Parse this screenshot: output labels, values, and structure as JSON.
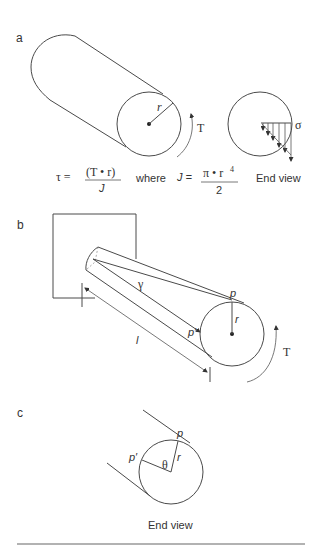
{
  "figure": {
    "panels": [
      {
        "id": "a",
        "label": "a",
        "radius_label": "r",
        "torque_label": "T",
        "stress_label": "σ",
        "end_view_label": "End view",
        "formula": {
          "lhs": "τ =",
          "numerator": "(T • r)",
          "denominator": "J",
          "connector": "where",
          "j_lhs": "J =",
          "j_numerator": "π • r",
          "j_exponent": "4",
          "j_denominator": "2"
        }
      },
      {
        "id": "b",
        "label": "b",
        "shear_angle_label": "γ",
        "point_label": "p",
        "point_prime_label": "p′",
        "radius_label": "r",
        "length_label": "l",
        "torque_label": "T"
      },
      {
        "id": "c",
        "label": "c",
        "point_label": "p",
        "point_prime_label": "p′",
        "angle_label": "θ",
        "radius_label": "r",
        "caption": "End view"
      }
    ],
    "colors": {
      "line": "#4a4a4a",
      "text": "#333333",
      "rule": "#999999"
    }
  }
}
